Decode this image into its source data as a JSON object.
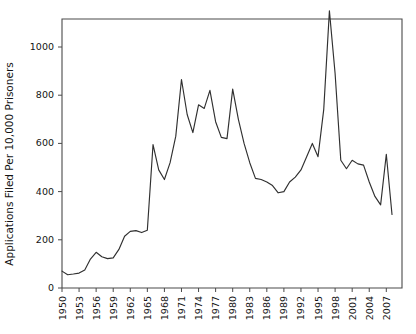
{
  "chart_data": {
    "type": "line",
    "title": "",
    "subtitle": "",
    "xlabel": "",
    "ylabel": "Applications Filed Per 10,000 Prisoners",
    "xlim": [
      1950,
      2008
    ],
    "ylim": [
      0,
      1150
    ],
    "grid": false,
    "legend": "none",
    "y_ticks": [
      0,
      200,
      400,
      600,
      800,
      1000
    ],
    "y_tick_labels": [
      "0",
      "200",
      "400",
      "600",
      "800",
      "1000"
    ],
    "x_ticks": [
      1950,
      1953,
      1956,
      1959,
      1962,
      1965,
      1968,
      1971,
      1974,
      1977,
      1980,
      1983,
      1986,
      1989,
      1992,
      1995,
      1998,
      2001,
      2004,
      2007
    ],
    "x_tick_labels": [
      "1950",
      "1953",
      "1956",
      "1959",
      "1962",
      "1965",
      "1968",
      "1971",
      "1974",
      "1977",
      "1980",
      "1983",
      "1986",
      "1989",
      "1992",
      "1995",
      "1998",
      "2001",
      "2004",
      "2007"
    ],
    "line_color": "#303030",
    "axis_color": "#4a4a4a",
    "background_color": "#ffffff",
    "series": [
      {
        "name": "Applications Filed Per 10,000 Prisoners",
        "x": [
          1950,
          1951,
          1952,
          1953,
          1954,
          1955,
          1956,
          1957,
          1958,
          1959,
          1960,
          1961,
          1962,
          1963,
          1964,
          1965,
          1966,
          1967,
          1968,
          1969,
          1970,
          1971,
          1972,
          1973,
          1974,
          1975,
          1976,
          1977,
          1978,
          1979,
          1980,
          1981,
          1982,
          1983,
          1984,
          1985,
          1986,
          1987,
          1988,
          1989,
          1990,
          1991,
          1992,
          1993,
          1994,
          1995,
          1996,
          1997,
          1998,
          1999,
          2000,
          2001,
          2002,
          2003,
          2004,
          2005,
          2006,
          2007,
          2008
        ],
        "y": [
          70,
          55,
          58,
          62,
          75,
          120,
          148,
          130,
          122,
          125,
          160,
          215,
          235,
          238,
          230,
          240,
          595,
          490,
          450,
          520,
          630,
          865,
          720,
          645,
          760,
          745,
          820,
          690,
          625,
          620,
          825,
          700,
          600,
          520,
          455,
          450,
          440,
          425,
          395,
          400,
          440,
          460,
          490,
          545,
          600,
          545,
          740,
          1150,
          890,
          530,
          495,
          530,
          515,
          510,
          440,
          380,
          345,
          555,
          305
        ]
      }
    ]
  }
}
